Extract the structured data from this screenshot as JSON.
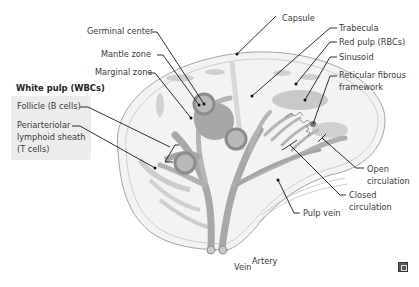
{
  "diagram": {
    "labels_left": {
      "germinal_center": "Germinal center",
      "mantle_zone": "Mantle zone",
      "marginal_zone": "Marginal zone"
    },
    "white_pulp": {
      "heading": "White pulp (WBCs)",
      "follicle": "Follicle (B cells)",
      "pals_line1": "Periarteriolar",
      "pals_line2": "lymphoid sheath",
      "pals_line3": "(T cells)"
    },
    "labels_right": {
      "capsule": "Capsule",
      "trabecula": "Trabecula",
      "red_pulp": "Red pulp (RBCs)",
      "sinusoid": "Sinusoid",
      "reticular_line1": "Reticular fibrous",
      "reticular_line2": "framework",
      "open_line1": "Open",
      "open_line2": "circulation",
      "closed_line1": "Closed",
      "closed_line2": "circulation",
      "pulp_vein": "Pulp vein"
    },
    "labels_bottom": {
      "vein": "Vein",
      "artery": "Artery"
    },
    "colors": {
      "outer_fill": "#f2f2f2",
      "capsule_line": "#9a9a9a",
      "red_pulp": "#c8c8c8",
      "vessel": "#a9a9a9",
      "follicle_ring": "#8f8f8f",
      "germinal_center": "#bdbdbd",
      "white_pulp_box": "#ececec"
    },
    "icons": {
      "corner": "expand-icon"
    }
  }
}
